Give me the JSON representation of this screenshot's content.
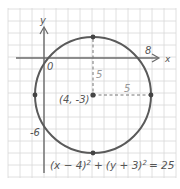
{
  "diagram": {
    "type": "circle-on-coordinate-grid",
    "axes": {
      "x_label": "x",
      "y_label": "y",
      "origin_label": "0"
    },
    "intercepts": {
      "x": "8",
      "y": "-6"
    },
    "center_label": "(4, -3)",
    "radius_labels": {
      "vertical": "5",
      "horizontal": "5"
    },
    "equation": {
      "part1": "(x − 4)",
      "exp1": "2",
      "plus": "+",
      "part2": "(y + 3)",
      "exp2": "2",
      "rhs": "= 25"
    },
    "colors": {
      "grid": "#d8d8d8",
      "axis": "#6a6a6a",
      "circle": "#5a5a5a",
      "text": "#555555",
      "dashed": "#777777"
    }
  }
}
